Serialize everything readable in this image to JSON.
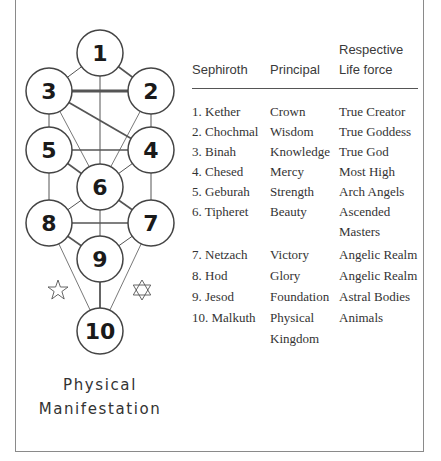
{
  "diagram": {
    "nodes": [
      {
        "id": "1",
        "label": "1",
        "cx": 100,
        "cy": 53
      },
      {
        "id": "2",
        "label": "2",
        "cx": 151,
        "cy": 91
      },
      {
        "id": "3",
        "label": "3",
        "cx": 49,
        "cy": 91
      },
      {
        "id": "4",
        "label": "4",
        "cx": 151,
        "cy": 150
      },
      {
        "id": "5",
        "label": "5",
        "cx": 49,
        "cy": 150
      },
      {
        "id": "6",
        "label": "6",
        "cx": 100,
        "cy": 187
      },
      {
        "id": "7",
        "label": "7",
        "cx": 151,
        "cy": 223
      },
      {
        "id": "8",
        "label": "8",
        "cx": 49,
        "cy": 223
      },
      {
        "id": "9",
        "label": "9",
        "cx": 100,
        "cy": 259
      },
      {
        "id": "10",
        "label": "10",
        "cx": 100,
        "cy": 331
      }
    ],
    "stars": [
      {
        "type": "five-point",
        "cx": 58,
        "cy": 290
      },
      {
        "type": "six-point",
        "cx": 142,
        "cy": 290
      }
    ],
    "caption_line1": "Physical",
    "caption_line2": "Manifestation"
  },
  "table": {
    "headers": {
      "sephiroth": "Sephiroth",
      "principal": "Principal",
      "lifeforce_line1": "Respective",
      "lifeforce_line2": "Life force"
    },
    "rows": [
      {
        "sephiroth": "1. Kether",
        "principal": "Crown",
        "lifeforce": "True Creator"
      },
      {
        "sephiroth": "2. Chochmal",
        "principal": "Wisdom",
        "lifeforce": "True Goddess"
      },
      {
        "sephiroth": "3. Binah",
        "principal": "Knowledge",
        "lifeforce": "True God"
      },
      {
        "sephiroth": "4. Chesed",
        "principal": "Mercy",
        "lifeforce": "Most High"
      },
      {
        "sephiroth": "5. Geburah",
        "principal": "Strength",
        "lifeforce": "Arch Angels"
      },
      {
        "sephiroth": "6. Tipheret",
        "principal": "Beauty",
        "lifeforce": "Ascended",
        "lifeforce2": "Masters"
      },
      {
        "sephiroth": "7. Netzach",
        "principal": "Victory",
        "lifeforce": "Angelic Realm"
      },
      {
        "sephiroth": "8. Hod",
        "principal": "Glory",
        "lifeforce": "Angelic Realm"
      },
      {
        "sephiroth": "9. Jesod",
        "principal": "Foundation",
        "lifeforce": "Astral Bodies"
      },
      {
        "sephiroth": "10. Malkuth",
        "principal": "Physical",
        "principal2": "Kingdom",
        "lifeforce": "Animals"
      }
    ]
  }
}
